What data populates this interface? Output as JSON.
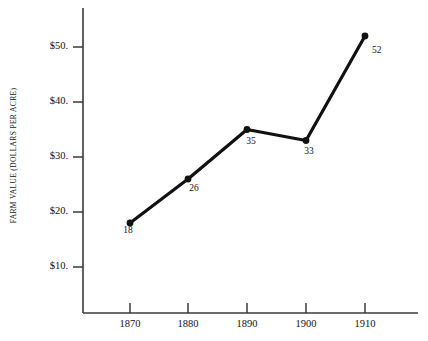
{
  "chart_data": {
    "type": "line",
    "title": "",
    "subtitle": "",
    "xlabel": "",
    "ylabel": "FARM VALUE (DOLLARS PER ACRE)",
    "categories": [
      "1870",
      "1880",
      "1890",
      "1900",
      "1910"
    ],
    "x": [
      1870,
      1880,
      1890,
      1900,
      1910
    ],
    "values": [
      18,
      26,
      35,
      33,
      52
    ],
    "point_labels": [
      "18",
      "26",
      "35",
      "33",
      "52"
    ],
    "series": [
      {
        "name": "Farm value per acre",
        "values": [
          18,
          26,
          35,
          33,
          52
        ]
      }
    ],
    "ytick_labels": [
      "$50.",
      "$40.",
      "$30.",
      "$20.",
      "$10."
    ],
    "ytick_values": [
      50,
      40,
      30,
      20,
      10
    ],
    "xtick_labels": [
      "1870",
      "1880",
      "1890",
      "1900",
      "1910"
    ],
    "ylim": [
      0,
      55
    ],
    "xlim": [
      1865,
      1915
    ],
    "grid": false,
    "legend": false,
    "legend_position": "none",
    "marker": "filled-circle",
    "line_color": "#111111",
    "marker_color": "#111111",
    "axis_color": "#3a3a3a",
    "background_color": "#ffffff"
  },
  "axes": {
    "y_axis_title": "FARM VALUE (DOLLARS PER ACRE)",
    "y_ticks": [
      {
        "label": "$50.",
        "value": 50
      },
      {
        "label": "$40.",
        "value": 40
      },
      {
        "label": "$30.",
        "value": 30
      },
      {
        "label": "$20.",
        "value": 20
      },
      {
        "label": "$10.",
        "value": 10
      }
    ],
    "x_ticks": [
      {
        "label": "1870",
        "value": 1870
      },
      {
        "label": "1880",
        "value": 1880
      },
      {
        "label": "1890",
        "value": 1890
      },
      {
        "label": "1900",
        "value": 1900
      },
      {
        "label": "1910",
        "value": 1910
      }
    ]
  },
  "points": [
    {
      "label": "18",
      "year": "1870",
      "value": 18
    },
    {
      "label": "26",
      "year": "1880",
      "value": 26
    },
    {
      "label": "35",
      "year": "1890",
      "value": 35
    },
    {
      "label": "33",
      "year": "1900",
      "value": 33
    },
    {
      "label": "52",
      "year": "1910",
      "value": 52
    }
  ]
}
